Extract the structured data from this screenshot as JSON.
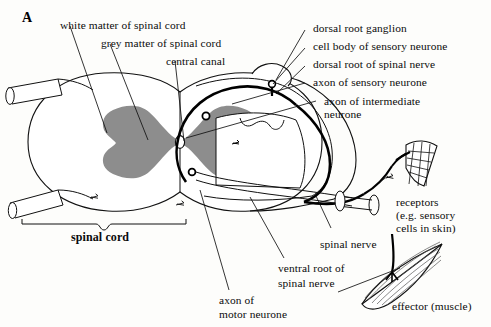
{
  "figure": {
    "panel_letter": "A",
    "colors": {
      "grey_matter": "#8d8d8d",
      "white_matter": "#ffffff",
      "outline": "#111111",
      "neuron": "#000000",
      "background": "#fdfdfb"
    }
  },
  "labels": {
    "white_matter": "white matter of spinal cord",
    "grey_matter": "grey matter of spinal cord",
    "central_canal": "central canal",
    "dorsal_root_ganglion": "dorsal root ganglion",
    "cell_body_sensory": "cell body of sensory neurone",
    "dorsal_root": "dorsal root of spinal nerve",
    "axon_sensory": "axon of sensory neurone",
    "axon_intermediate_line1": "axon of intermediate",
    "axon_intermediate_line2": "neurone",
    "receptors_line1": "receptors",
    "receptors_line2": "(e.g. sensory",
    "receptors_line3": "cells in skin)",
    "spinal_nerve": "spinal nerve",
    "ventral_root_line1": "ventral root of",
    "ventral_root_line2": "spinal nerve",
    "effector": "effector (muscle)",
    "axon_motor_line1": "axon of",
    "axon_motor_line2": "motor neurone",
    "spinal_cord": "spinal cord"
  }
}
